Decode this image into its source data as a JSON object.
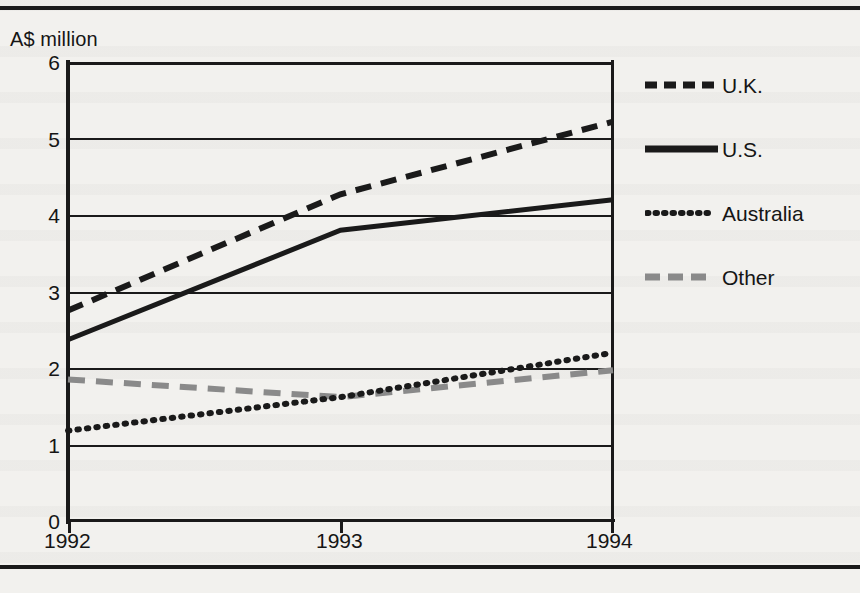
{
  "figure": {
    "axis_unit_label": "A$ million"
  },
  "chart_data": {
    "type": "line",
    "title": "",
    "subtitle": "",
    "xlabel": "",
    "ylabel": "A$ million",
    "x": [
      "1992",
      "1993",
      "1994"
    ],
    "categories": [
      "1992",
      "1993",
      "1994"
    ],
    "xticks": [
      "1992",
      "1993",
      "1994"
    ],
    "yticks": [
      "0",
      "1",
      "2",
      "3",
      "4",
      "5",
      "6"
    ],
    "ylim": [
      0,
      6
    ],
    "grid": "horizontal",
    "legend_position": "right",
    "series": [
      {
        "name": "U.K.",
        "values": [
          2.75,
          4.27,
          5.22
        ],
        "style": "dashed",
        "color": "#1a1a1a"
      },
      {
        "name": "U.S.",
        "values": [
          2.37,
          3.8,
          4.2
        ],
        "style": "solid",
        "color": "#1a1a1a"
      },
      {
        "name": "Australia",
        "values": [
          1.18,
          1.62,
          2.2
        ],
        "style": "dotted",
        "color": "#1a1a1a"
      },
      {
        "name": "Other",
        "values": [
          1.85,
          1.62,
          1.97
        ],
        "style": "dashed",
        "color": "#8a8a8a"
      }
    ]
  },
  "yticks": {
    "t0": "0",
    "t1": "1",
    "t2": "2",
    "t3": "3",
    "t4": "4",
    "t5": "5",
    "t6": "6"
  },
  "xticks": {
    "t1992": "1992",
    "t1993": "1993",
    "t1994": "1994"
  },
  "legend": {
    "items": [
      {
        "label": "U.K.",
        "swatch": "dashed-line-swatch"
      },
      {
        "label": "U.S.",
        "swatch": "solid-line-swatch"
      },
      {
        "label": "Australia",
        "swatch": "dotted-line-swatch"
      },
      {
        "label": "Other",
        "swatch": "gray-dashed-line-swatch"
      }
    ]
  },
  "colors": {
    "ink": "#1a1a1a",
    "gray_series": "#8a8a8a",
    "paper": "#f2f1ee"
  }
}
